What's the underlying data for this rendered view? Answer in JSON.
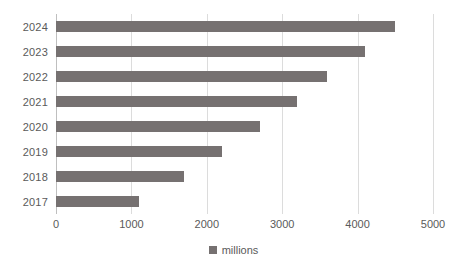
{
  "chart_data": {
    "type": "bar",
    "orientation": "horizontal",
    "title": "",
    "subtitle": "",
    "xlabel": "",
    "ylabel": "",
    "categories": [
      "2024",
      "2023",
      "2022",
      "2021",
      "2020",
      "2019",
      "2018",
      "2017"
    ],
    "values": [
      4500,
      4100,
      3600,
      3200,
      2700,
      2200,
      1700,
      1100
    ],
    "series": [
      {
        "name": "millions",
        "color": "#767171",
        "values": [
          4500,
          4100,
          3600,
          3200,
          2700,
          2200,
          1700,
          1100
        ]
      }
    ],
    "xlim": [
      0,
      5000
    ],
    "xticks": [
      0,
      1000,
      2000,
      3000,
      4000,
      5000
    ],
    "xtick_labels": [
      "0",
      "1000",
      "2000",
      "3000",
      "4000",
      "5000"
    ],
    "ytick_labels": [
      "2024",
      "2023",
      "2022",
      "2021",
      "2020",
      "2019",
      "2018",
      "2017"
    ],
    "grid": "vertical",
    "legend": {
      "position": "bottom",
      "entries": [
        {
          "label": "millions",
          "color": "#767171"
        }
      ]
    },
    "colors": {
      "bar": "#767171",
      "gridline": "#dcdcdc",
      "axis": "#bfbfbf",
      "text": "#5a5a5a",
      "background": "#ffffff"
    }
  }
}
